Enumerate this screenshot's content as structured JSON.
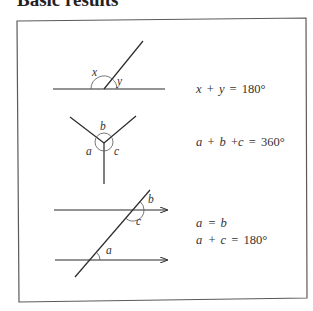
{
  "title": "Basic results",
  "panels": [
    {
      "name": "angles-on-straight-line",
      "labels": {
        "x": "x",
        "y": "y"
      },
      "equation": {
        "var1": "x",
        "op1": "+",
        "var2": "y",
        "eq": "=",
        "value": "180°"
      }
    },
    {
      "name": "angles-at-a-point",
      "labels": {
        "a": "a",
        "b": "b",
        "c": "c"
      },
      "equation": {
        "var1": "a",
        "op1": "+",
        "var2": "b",
        "op2": "+",
        "var3": "c",
        "eq": "=",
        "value": "360°"
      }
    },
    {
      "name": "parallel-lines-transversal",
      "labels": {
        "a": "a",
        "b": "b",
        "c": "c"
      },
      "equations": [
        {
          "lhs": "a",
          "eq": "=",
          "rhs": "b"
        },
        {
          "var1": "a",
          "op1": "+",
          "var2": "c",
          "eq": "=",
          "value": "180°"
        }
      ]
    }
  ],
  "colors": {
    "line": "#2b2b2b",
    "arc": "#555555",
    "box_border": "#5a5a5a"
  }
}
